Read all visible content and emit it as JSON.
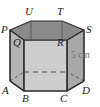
{
  "figure": {
    "name": "hexagonal-prism",
    "colors": {
      "top_face": "#8a8a8a",
      "front_face": "#cdcdcd",
      "left_face": "#b4b4b4",
      "right_face": "#a8a8a8",
      "outline": "#2b2b2b",
      "hidden_line": "#4a4a4a",
      "label": "#1a1a1a",
      "dimension_label": "#6f6f6f",
      "background": "#ffffff"
    },
    "top_vertices": [
      {
        "id": "P",
        "label": "P",
        "x": 10,
        "y": 30,
        "label_x": 1,
        "label_y": 24
      },
      {
        "id": "U",
        "label": "U",
        "x": 31,
        "y": 21,
        "label_x": 25,
        "label_y": 6
      },
      {
        "id": "T",
        "label": "T",
        "x": 62,
        "y": 21,
        "label_x": 57,
        "label_y": 6
      },
      {
        "id": "S",
        "label": "S",
        "x": 84,
        "y": 30,
        "label_x": 86,
        "label_y": 24
      },
      {
        "id": "R",
        "label": "R",
        "x": 67,
        "y": 40,
        "label_x": 57,
        "label_y": 37
      },
      {
        "id": "Q",
        "label": "Q",
        "x": 24,
        "y": 40,
        "label_x": 13,
        "label_y": 37
      }
    ],
    "bottom_vertices": [
      {
        "id": "A",
        "label": "A",
        "x": 10,
        "y": 81,
        "label_x": 2,
        "label_y": 85
      },
      {
        "id": "B",
        "label": "B",
        "x": 24,
        "y": 91,
        "label_x": 22,
        "label_y": 93
      },
      {
        "id": "C",
        "label": "C",
        "x": 67,
        "y": 91,
        "label_x": 60,
        "label_y": 93
      },
      {
        "id": "D",
        "label": "D",
        "x": 84,
        "y": 81,
        "label_x": 82,
        "label_y": 85
      }
    ],
    "dimension": {
      "id": "height",
      "text": "5 cm",
      "label_x": 71,
      "label_y": 50
    }
  }
}
